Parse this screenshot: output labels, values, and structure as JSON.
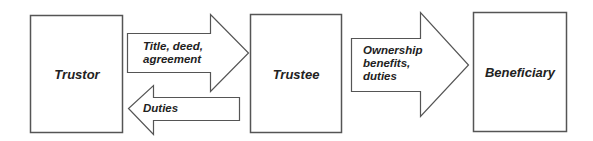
{
  "diagram": {
    "type": "flow",
    "colors": {
      "stroke": "#555555",
      "fill": "#ffffff",
      "text": "#222222",
      "background": "#ffffff"
    },
    "nodes": [
      {
        "id": "trustor",
        "label": "Trustor"
      },
      {
        "id": "trustee",
        "label": "Trustee"
      },
      {
        "id": "beneficiary",
        "label": "Beneficiary"
      }
    ],
    "edges": [
      {
        "from": "trustor",
        "to": "trustee",
        "direction": "right",
        "label": "Title, deed,\nagreement"
      },
      {
        "from": "trustee",
        "to": "trustor",
        "direction": "left",
        "label": "Duties"
      },
      {
        "from": "trustee",
        "to": "beneficiary",
        "direction": "right",
        "label": "Ownership\nbenefits,\nduties"
      }
    ]
  }
}
